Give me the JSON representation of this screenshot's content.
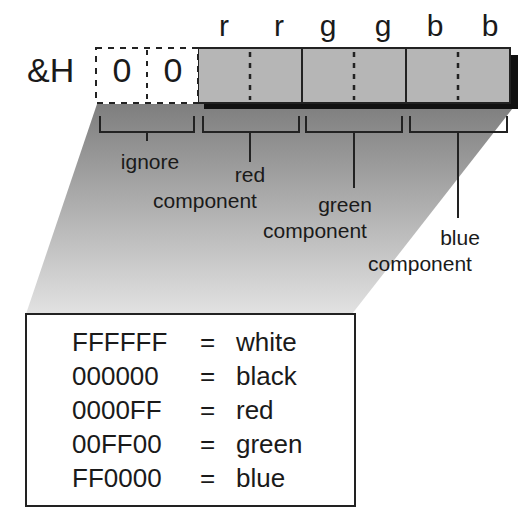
{
  "diagram": {
    "prefix": "&H",
    "ignore_digits": [
      "0",
      "0"
    ],
    "byte_letters": [
      "r",
      "r",
      "g",
      "g",
      "b",
      "b"
    ],
    "components": [
      {
        "id": "ignore",
        "line1": "ignore",
        "line2": ""
      },
      {
        "id": "red",
        "line1": "red",
        "line2": "component"
      },
      {
        "id": "green",
        "line1": "green",
        "line2": "component"
      },
      {
        "id": "blue",
        "line1": "blue",
        "line2": "component"
      }
    ],
    "colors": {
      "bar_fill": "#b4b4b4",
      "shadow": "#111111",
      "gradient_top": "#8a8a8a",
      "gradient_bottom": "#dcdcdc",
      "ink": "#1a1a1a"
    }
  },
  "legend": {
    "rows": [
      {
        "hex": "FFFFFF",
        "eq": "=",
        "name": "white"
      },
      {
        "hex": "000000",
        "eq": "=",
        "name": "black"
      },
      {
        "hex": "0000FF",
        "eq": "=",
        "name": "red"
      },
      {
        "hex": "00FF00",
        "eq": "=",
        "name": "green"
      },
      {
        "hex": "FF0000",
        "eq": "=",
        "name": "blue"
      }
    ]
  }
}
